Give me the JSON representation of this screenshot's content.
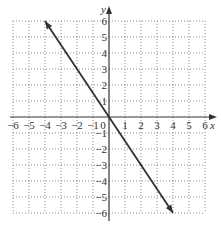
{
  "chart_data": {
    "type": "line",
    "title": "",
    "xlabel": "x",
    "ylabel": "y",
    "xlim": [
      -6,
      6
    ],
    "ylim": [
      -6,
      6
    ],
    "grid": true,
    "grid_style": "dotted",
    "x_ticks": [
      "-6",
      "-5",
      "-4",
      "-3",
      "-2",
      "-1",
      "0",
      "1",
      "2",
      "3",
      "4",
      "5",
      "6"
    ],
    "y_ticks": [
      "6",
      "5",
      "4",
      "3",
      "2",
      "1",
      "-1",
      "-2",
      "-3",
      "-4",
      "-5",
      "-6"
    ],
    "series": [
      {
        "name": "y = -3/2 x",
        "x": [
          -4,
          0,
          4
        ],
        "y": [
          6,
          0,
          -6
        ],
        "arrows": "both"
      }
    ],
    "colors": {
      "line": "#333333",
      "grid": "#888888",
      "axis": "#333333"
    }
  }
}
